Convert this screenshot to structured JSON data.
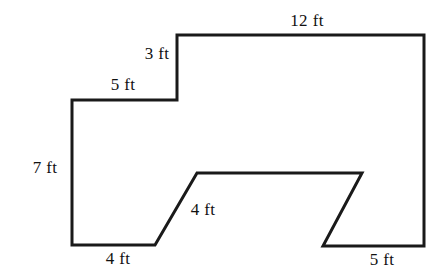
{
  "figure": {
    "name": "composite-polygon-figure",
    "stroke_color": "#1a1a1a",
    "fill_color": "#ffffff",
    "background_color": "#ffffff",
    "stroke_width": 3,
    "unit": "ft",
    "outline_points": "177,35 424,35 424,246 323,246 362,173 197,173 155,245 72,245 72,100 177,100",
    "vertices": [
      {
        "name": "step-top-left",
        "x": 177,
        "y": 35
      },
      {
        "name": "top-right",
        "x": 424,
        "y": 35
      },
      {
        "name": "bottom-right",
        "x": 424,
        "y": 246
      },
      {
        "name": "notch-bottom-right",
        "x": 323,
        "y": 246
      },
      {
        "name": "notch-top-right",
        "x": 362,
        "y": 173
      },
      {
        "name": "notch-top-left",
        "x": 197,
        "y": 173
      },
      {
        "name": "notch-bottom-left",
        "x": 155,
        "y": 245
      },
      {
        "name": "bottom-left",
        "x": 72,
        "y": 245
      },
      {
        "name": "left-top",
        "x": 72,
        "y": 100
      },
      {
        "name": "step-inner-corner",
        "x": 177,
        "y": 100
      }
    ]
  },
  "labels": [
    {
      "id": "top-edge",
      "text": "12 ft",
      "value": 12,
      "unit": "ft",
      "edge": "top",
      "x": 307,
      "y": 20
    },
    {
      "id": "step-riser",
      "text": "3 ft",
      "value": 3,
      "unit": "ft",
      "edge": "step-vertical",
      "x": 157,
      "y": 53
    },
    {
      "id": "step-tread",
      "text": "5 ft",
      "value": 5,
      "unit": "ft",
      "edge": "step-horizontal",
      "x": 123,
      "y": 84
    },
    {
      "id": "left-edge",
      "text": "7 ft",
      "value": 7,
      "unit": "ft",
      "edge": "left",
      "x": 45,
      "y": 167
    },
    {
      "id": "bottom-left-edge",
      "text": "4 ft",
      "value": 4,
      "unit": "ft",
      "edge": "bottom-left",
      "x": 118,
      "y": 258
    },
    {
      "id": "notch-left-slant",
      "text": "4 ft",
      "value": 4,
      "unit": "ft",
      "edge": "notch-left-diagonal",
      "x": 203,
      "y": 209
    },
    {
      "id": "bottom-right-edge",
      "text": "5 ft",
      "value": 5,
      "unit": "ft",
      "edge": "bottom-right",
      "x": 382,
      "y": 259
    }
  ]
}
